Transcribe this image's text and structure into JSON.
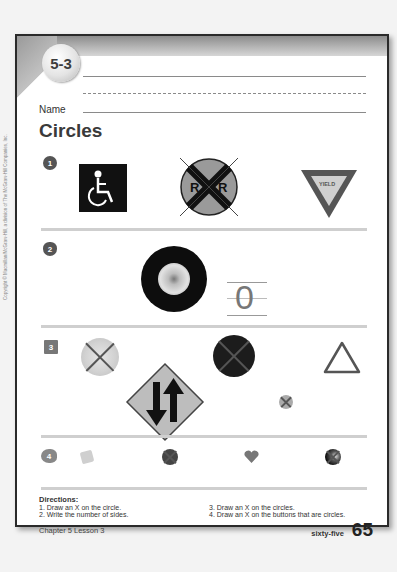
{
  "header": {
    "lesson_number": "5-3",
    "name_label": "Name",
    "title": "Circles"
  },
  "exercises": [
    {
      "number": "1",
      "badge_shape": "circle",
      "items": [
        {
          "name": "handicap-sign",
          "marked_x": false
        },
        {
          "name": "railroad-crossing-sign",
          "label": "R   R",
          "marked_x": true
        },
        {
          "name": "yield-sign",
          "label": "YIELD",
          "marked_x": false
        }
      ]
    },
    {
      "number": "2",
      "badge_shape": "apple",
      "items": [
        {
          "name": "tire",
          "marked_x": false
        }
      ],
      "answer": "0"
    },
    {
      "number": "3",
      "badge_shape": "square",
      "items": [
        {
          "name": "round-plate",
          "marked_x": true
        },
        {
          "name": "two-way-traffic-diamond-sign",
          "marked_x": false
        },
        {
          "name": "black-round-lid",
          "marked_x": true
        },
        {
          "name": "small-round-object",
          "marked_x": true
        },
        {
          "name": "triangle-instrument",
          "marked_x": false
        }
      ]
    },
    {
      "number": "4",
      "badge_shape": "fish",
      "items": [
        {
          "name": "square-button",
          "marked_x": false
        },
        {
          "name": "round-button-dark",
          "marked_x": true
        },
        {
          "name": "heart-button",
          "marked_x": false
        },
        {
          "name": "round-button-black",
          "marked_x": true
        }
      ]
    }
  ],
  "directions": {
    "title": "Directions:",
    "items": [
      "1.  Draw an X on the circle.",
      "2.  Write the number of sides.",
      "3.  Draw an X on the circles.",
      "4.  Draw an X on the buttons that are circles."
    ]
  },
  "footer": {
    "chapter_lesson": "Chapter 5    Lesson 3",
    "page_word": "sixty-five",
    "page_number": "65"
  },
  "copyright": "Copyright © Macmillan/McGraw-Hill, a division of The McGraw-Hill Companies, Inc."
}
